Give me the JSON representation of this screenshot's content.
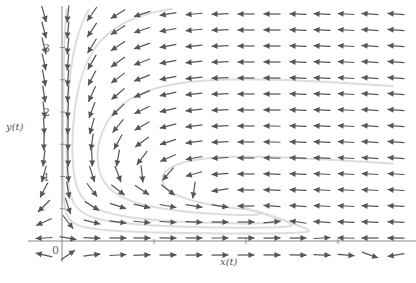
{
  "chart_data": {
    "type": "direction_field",
    "title": "",
    "xlabel": "x(t)",
    "ylabel": "y(t)",
    "xlim": [
      -0.25,
      3.7
    ],
    "ylim": [
      -0.3,
      3.7
    ],
    "x_ticks": [
      1,
      2,
      3
    ],
    "y_ticks": [
      1,
      2,
      3
    ],
    "y_tick_labels": [
      "1",
      "2",
      "3"
    ],
    "origin_label": "0",
    "grid": false,
    "system": {
      "dx_dt": "x(3 - x) - 2xy",
      "dy_dt": "y(-1 + 0.5x)"
    },
    "arrow_columns_px": [
      44,
      68,
      92,
      118,
      142,
      168,
      194,
      220,
      246,
      272,
      298,
      322,
      346,
      370,
      396
    ],
    "arrow_rows_px": [
      14,
      30,
      46,
      62,
      78,
      94,
      110,
      126,
      142,
      158,
      174,
      190,
      206,
      222,
      238,
      255
    ],
    "arrow_color": "#555555",
    "trajectory_color": "#dddddd",
    "axis_color": "#888888"
  },
  "axes": {
    "origin_px": [
      62,
      241
    ],
    "x_unit_px": 92,
    "y_unit_px": 64.5
  }
}
